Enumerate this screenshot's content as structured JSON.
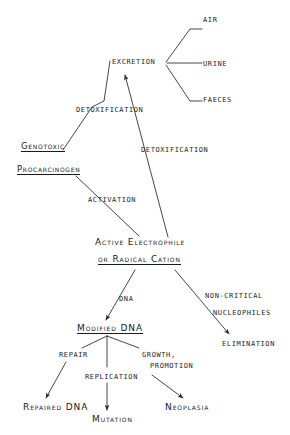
{
  "diagram": {
    "stroke_color": "#262626",
    "text_color": "#1a1a1a",
    "background": "#ffffff",
    "nodes": [
      {
        "id": "air",
        "label": "AIR",
        "style": "plain",
        "x": 203,
        "y": 17
      },
      {
        "id": "urine",
        "label": "URINE",
        "style": "plain",
        "x": 203,
        "y": 61
      },
      {
        "id": "faeces",
        "label": "FAECES",
        "style": "plain",
        "x": 203,
        "y": 97
      },
      {
        "id": "excretion",
        "label": "EXCRETION",
        "style": "plain",
        "x": 112,
        "y": 59
      },
      {
        "id": "detox1",
        "label": "DETOXIFICATION",
        "style": "plain",
        "x": 76,
        "y": 107
      },
      {
        "id": "detox2",
        "label": "DETOXIFICATION",
        "style": "plain",
        "x": 141,
        "y": 147
      },
      {
        "id": "genotoxic",
        "label": "Genotoxic",
        "style": "underlined",
        "x": 21,
        "y": 144
      },
      {
        "id": "procarcinogen",
        "label": "Procarcinogen",
        "style": "underlined",
        "x": 17,
        "y": 167
      },
      {
        "id": "activation",
        "label": "ACTIVATION",
        "style": "plain",
        "x": 88,
        "y": 197
      },
      {
        "id": "electrophile",
        "label": "Active Electrophile",
        "style": "big",
        "x": 95,
        "y": 239
      },
      {
        "id": "radical",
        "label": "or Radical Cation",
        "style": "big-underlined",
        "x": 98,
        "y": 256
      },
      {
        "id": "dna_label",
        "label": "DNA",
        "style": "plain",
        "x": 119,
        "y": 296
      },
      {
        "id": "noncritical",
        "label": "NON-CRITICAL",
        "style": "plain",
        "x": 205,
        "y": 293
      },
      {
        "id": "nucleophiles",
        "label": "NUCLEOPHILES",
        "style": "plain",
        "x": 213,
        "y": 310
      },
      {
        "id": "elimination",
        "label": "ELIMINATION",
        "style": "plain",
        "x": 222,
        "y": 341
      },
      {
        "id": "modified_dna",
        "label": "Modified DNA",
        "style": "big-underlined",
        "x": 77,
        "y": 325
      },
      {
        "id": "repair",
        "label": "REPAIR",
        "style": "plain",
        "x": 59,
        "y": 352
      },
      {
        "id": "replication",
        "label": "REPLICATION",
        "style": "plain",
        "x": 85,
        "y": 374
      },
      {
        "id": "growth",
        "label": "GROWTH,",
        "style": "plain",
        "x": 142,
        "y": 352
      },
      {
        "id": "promotion",
        "label": "PROMOTION",
        "style": "plain",
        "x": 150,
        "y": 363
      },
      {
        "id": "repaired_dna",
        "label": "Repaired DNA",
        "style": "big",
        "x": 23,
        "y": 404
      },
      {
        "id": "mutation",
        "label": "Mutation",
        "style": "big",
        "x": 92,
        "y": 416
      },
      {
        "id": "neoplasia",
        "label": "Neoplasia",
        "style": "big",
        "x": 165,
        "y": 404
      }
    ],
    "edges": [
      {
        "id": "edge-excretion-air",
        "from": "excretion",
        "to": "air",
        "arrow": false
      },
      {
        "id": "edge-excretion-urine",
        "from": "excretion",
        "to": "urine",
        "arrow": false
      },
      {
        "id": "edge-excretion-faeces",
        "from": "excretion",
        "to": "faeces",
        "arrow": false
      },
      {
        "id": "edge-procarcinogen-excretion",
        "from": "procarcinogen",
        "to": "excretion",
        "label": "DETOXIFICATION",
        "arrow": false
      },
      {
        "id": "edge-electrophile-excretion",
        "from": "electrophile",
        "to": "excretion",
        "label": "DETOXIFICATION",
        "arrow": true
      },
      {
        "id": "edge-procarcinogen-electrophile",
        "from": "procarcinogen",
        "to": "electrophile",
        "label": "ACTIVATION",
        "arrow": false
      },
      {
        "id": "edge-radical-modifieddna",
        "from": "radical",
        "to": "modified_dna",
        "label": "DNA",
        "arrow": true
      },
      {
        "id": "edge-radical-elimination",
        "from": "radical",
        "to": "elimination",
        "label": "NON-CRITICAL NUCLEOPHILES",
        "arrow": true
      },
      {
        "id": "edge-modifieddna-repaired",
        "from": "modified_dna",
        "to": "repaired_dna",
        "label": "REPAIR",
        "arrow": true
      },
      {
        "id": "edge-modifieddna-mutation",
        "from": "modified_dna",
        "to": "mutation",
        "label": "REPLICATION",
        "arrow": true
      },
      {
        "id": "edge-modifieddna-neoplasia",
        "from": "modified_dna",
        "to": "neoplasia",
        "label": "GROWTH, PROMOTION",
        "arrow": true
      }
    ]
  }
}
